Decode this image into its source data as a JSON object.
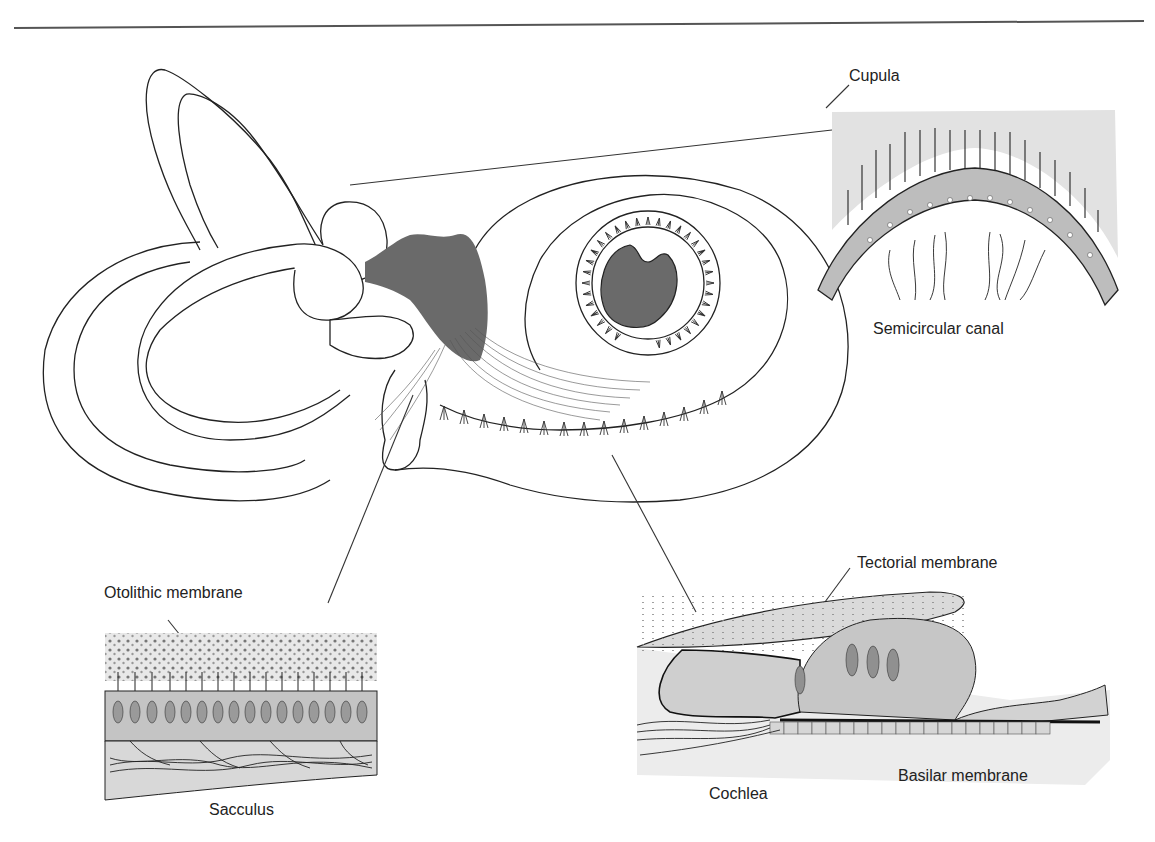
{
  "figure": {
    "colors": {
      "line": "#222222",
      "nerve_fill": "#6a6a6a",
      "tissue_light": "#e6e6e6",
      "tissue_mid": "#c8c8c8",
      "hair_cell_dark": "#8c8c8c",
      "background": "#ffffff"
    }
  },
  "labels": {
    "cupula": "Cupula",
    "semicircular_canal": "Semicircular canal",
    "otolithic_membrane": "Otolithic membrane",
    "sacculus": "Sacculus",
    "tectorial_membrane": "Tectorial membrane",
    "cochlea": "Cochlea",
    "basilar_membrane": "Basilar membrane"
  },
  "insets": [
    {
      "name": "semicircular-canal-crista",
      "caption": "Semicircular canal",
      "sublabel": "Cupula"
    },
    {
      "name": "sacculus-macula",
      "caption": "Sacculus",
      "sublabel": "Otolithic membrane"
    },
    {
      "name": "organ-of-corti",
      "caption": "Cochlea",
      "sublabels": [
        "Tectorial membrane",
        "Basilar membrane"
      ]
    }
  ]
}
